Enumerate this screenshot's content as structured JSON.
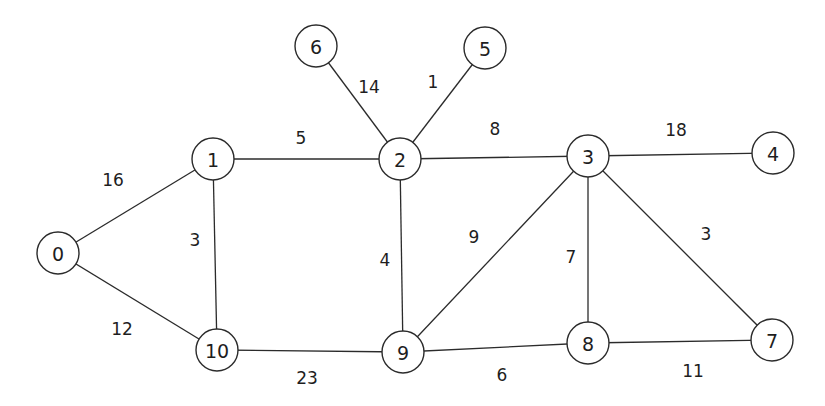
{
  "graph": {
    "type": "undirected-weighted-graph",
    "node_radius": 21,
    "stroke_color": "#2b2b2b",
    "background_color": "#ffffff",
    "nodes": [
      {
        "id": "0",
        "label": "0",
        "x": 58,
        "y": 253
      },
      {
        "id": "1",
        "label": "1",
        "x": 213,
        "y": 159
      },
      {
        "id": "2",
        "label": "2",
        "x": 400,
        "y": 159
      },
      {
        "id": "3",
        "label": "3",
        "x": 588,
        "y": 156
      },
      {
        "id": "4",
        "label": "4",
        "x": 773,
        "y": 153
      },
      {
        "id": "5",
        "label": "5",
        "x": 485,
        "y": 48
      },
      {
        "id": "6",
        "label": "6",
        "x": 316,
        "y": 46
      },
      {
        "id": "7",
        "label": "7",
        "x": 772,
        "y": 340
      },
      {
        "id": "8",
        "label": "8",
        "x": 588,
        "y": 343
      },
      {
        "id": "9",
        "label": "9",
        "x": 403,
        "y": 352
      },
      {
        "id": "10",
        "label": "10",
        "x": 217,
        "y": 350
      }
    ],
    "edges": [
      {
        "from": "0",
        "to": "1",
        "weight": "16",
        "label_x": 113,
        "label_y": 180
      },
      {
        "from": "0",
        "to": "10",
        "weight": "12",
        "label_x": 122,
        "label_y": 329
      },
      {
        "from": "1",
        "to": "2",
        "weight": "5",
        "label_x": 301,
        "label_y": 138
      },
      {
        "from": "1",
        "to": "10",
        "weight": "3",
        "label_x": 195,
        "label_y": 240
      },
      {
        "from": "2",
        "to": "6",
        "weight": "14",
        "label_x": 369,
        "label_y": 87
      },
      {
        "from": "2",
        "to": "5",
        "weight": "1",
        "label_x": 433,
        "label_y": 82
      },
      {
        "from": "2",
        "to": "3",
        "weight": "8",
        "label_x": 495,
        "label_y": 129
      },
      {
        "from": "2",
        "to": "9",
        "weight": "4",
        "label_x": 385,
        "label_y": 260
      },
      {
        "from": "3",
        "to": "4",
        "weight": "18",
        "label_x": 676,
        "label_y": 130
      },
      {
        "from": "3",
        "to": "9",
        "weight": "9",
        "label_x": 474,
        "label_y": 237
      },
      {
        "from": "3",
        "to": "8",
        "weight": "7",
        "label_x": 571,
        "label_y": 257
      },
      {
        "from": "3",
        "to": "7",
        "weight": "3",
        "label_x": 706,
        "label_y": 234
      },
      {
        "from": "10",
        "to": "9",
        "weight": "23",
        "label_x": 307,
        "label_y": 378
      },
      {
        "from": "9",
        "to": "8",
        "weight": "6",
        "label_x": 502,
        "label_y": 375
      },
      {
        "from": "8",
        "to": "7",
        "weight": "11",
        "label_x": 693,
        "label_y": 371
      }
    ]
  }
}
